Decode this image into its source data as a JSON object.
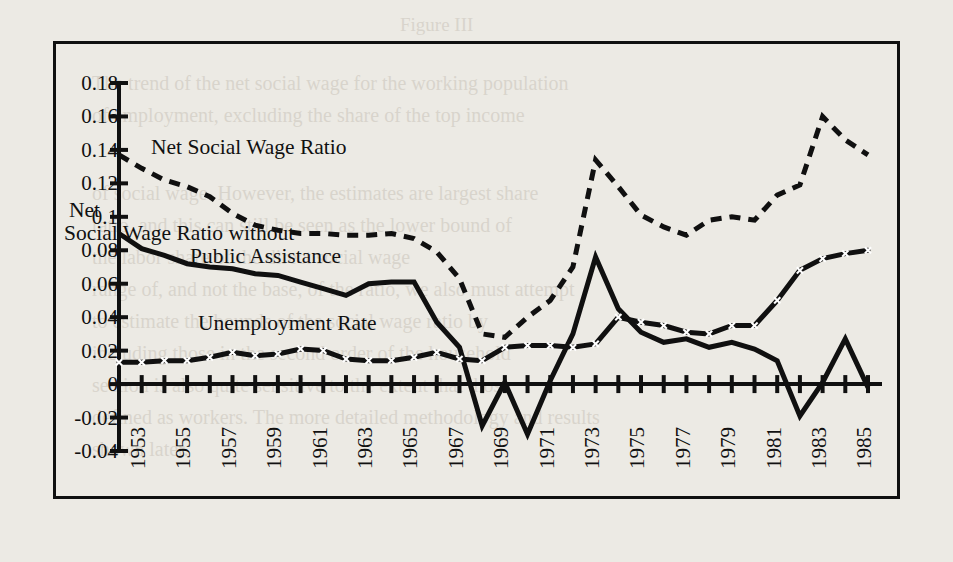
{
  "figure": {
    "caption_top": "Figure III",
    "border_color": "#101010",
    "background": "#eceae4"
  },
  "chart_data": {
    "type": "line",
    "title": "",
    "xlabel": "",
    "ylabel": "",
    "grid": false,
    "legend": "inline-annotations",
    "xlim": [
      1953,
      1986
    ],
    "ylim": [
      -0.04,
      0.18
    ],
    "ytick_labels": [
      "0.18",
      "0.16",
      "0.14",
      "0.12",
      "0.1",
      "0.08",
      "0.06",
      "0.04",
      "0.02",
      "0",
      "-0.02",
      "-0.04"
    ],
    "ytick_values": [
      0.18,
      0.16,
      0.14,
      0.12,
      0.1,
      0.08,
      0.06,
      0.04,
      0.02,
      0,
      -0.02,
      -0.04
    ],
    "xtick_labels": [
      "1953",
      "1955",
      "1957",
      "1959",
      "1961",
      "1963",
      "1965",
      "1967",
      "1969",
      "1971",
      "1973",
      "1975",
      "1977",
      "1979",
      "1981",
      "1983",
      "1985"
    ],
    "x": [
      1953,
      1954,
      1955,
      1956,
      1957,
      1958,
      1959,
      1960,
      1961,
      1962,
      1963,
      1964,
      1965,
      1966,
      1967,
      1968,
      1969,
      1970,
      1971,
      1972,
      1973,
      1974,
      1975,
      1976,
      1977,
      1978,
      1979,
      1980,
      1981,
      1982,
      1983,
      1984,
      1985,
      1986
    ],
    "series": [
      {
        "name": "Net Social Wage Ratio",
        "style": "dashed",
        "color": "#101010",
        "values": [
          0.137,
          0.129,
          0.122,
          0.118,
          0.112,
          0.102,
          0.095,
          0.092,
          0.09,
          0.09,
          0.089,
          0.089,
          0.09,
          0.087,
          0.079,
          0.063,
          0.03,
          0.028,
          0.04,
          0.05,
          0.07,
          0.134,
          0.118,
          0.101,
          0.094,
          0.089,
          0.098,
          0.1,
          0.098,
          0.113,
          0.119,
          0.16,
          0.146,
          0.137
        ]
      },
      {
        "name": "Net Social Wage Ratio without Public Assistance",
        "style": "solid",
        "color": "#101010",
        "values": [
          0.09,
          0.081,
          0.077,
          0.072,
          0.07,
          0.069,
          0.066,
          0.065,
          0.061,
          0.057,
          0.053,
          0.06,
          0.061,
          0.061,
          0.037,
          0.022,
          -0.025,
          0.001,
          -0.03,
          0.002,
          0.03,
          0.076,
          0.045,
          0.031,
          0.025,
          0.027,
          0.022,
          0.025,
          0.021,
          0.014,
          -0.019,
          0.001,
          0.027,
          -0.002
        ]
      },
      {
        "name": "Unemployment Rate",
        "style": "marker-line",
        "marker": "x",
        "color": "#101010",
        "values": [
          0.013,
          0.013,
          0.014,
          0.014,
          0.016,
          0.019,
          0.017,
          0.018,
          0.021,
          0.02,
          0.015,
          0.014,
          0.014,
          0.016,
          0.019,
          0.015,
          0.014,
          0.022,
          0.023,
          0.023,
          0.022,
          0.024,
          0.04,
          0.037,
          0.035,
          0.031,
          0.03,
          0.035,
          0.035,
          0.05,
          0.068,
          0.075,
          0.078,
          0.08
        ]
      }
    ],
    "annotations": [
      {
        "text": "Net Social Wage Ratio",
        "series": "Net Social Wage Ratio"
      },
      {
        "text": "Net Social Wage Ratio without Public Assistance",
        "series": "Net Social Wage Ratio without Public Assistance"
      },
      {
        "text": "Unemployment Rate",
        "series": "Unemployment Rate"
      }
    ]
  },
  "annotation_lines": {
    "net_social_wage_ratio": "Net Social Wage Ratio",
    "net_without_1": "Net",
    "net_without_2": "Social Wage Ratio without",
    "net_without_3": "Public Assistance",
    "unemployment_rate": "Unemployment Rate"
  },
  "bleed_text": {
    "l0": "Figure III",
    "l1": "The trend of the net social wage for the working population",
    "l2": "of employment, excluding the share of the top income",
    "l3": "of social wage. However, the estimates are largest share",
    "l4": "ratio, and this can still be seen as the lower bound of",
    "l5": "the labor share of the direct social wage",
    "l6": "range of, and not the base, of the ratio, we also must attempt",
    "l7": "to estimate the bounds of the social wage ratio by",
    "l8": "including those in the second order of the household",
    "l9": "section is also quite sensitive to the extent that those",
    "l10": "defined as workers. The more detailed methodology and results",
    "l11": "shown later."
  }
}
